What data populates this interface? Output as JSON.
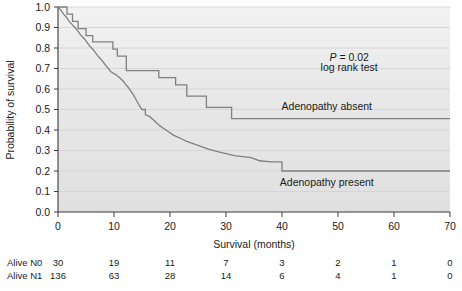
{
  "chart_data": {
    "type": "line",
    "title": "",
    "xlabel": "Survival (months)",
    "ylabel": "Probability of survival",
    "xlim": [
      0,
      70
    ],
    "ylim": [
      0,
      1.0
    ],
    "xticks": [
      0,
      10,
      20,
      30,
      40,
      50,
      60,
      70
    ],
    "yticks": [
      "0.0",
      "0.1",
      "0.2",
      "0.3",
      "0.4",
      "0.5",
      "0.6",
      "0.7",
      "0.8",
      "0.9",
      "1.0"
    ],
    "grid": true,
    "legend": "inline-labels",
    "annotations": [
      {
        "name": "p-value",
        "text": "P = 0.02",
        "x": 52,
        "y": 0.755
      },
      {
        "name": "test-name",
        "text": "log rank test",
        "x": 52,
        "y": 0.705
      },
      {
        "name": "series-label-absent",
        "text": "Adenopathy absent",
        "x": 48,
        "y": 0.515
      },
      {
        "name": "series-label-present",
        "text": "Adenopathy present",
        "x": 48,
        "y": 0.145
      }
    ],
    "series": [
      {
        "name": "Adenopathy absent",
        "group": "N0",
        "color": "#808080",
        "points": [
          [
            0,
            1.0
          ],
          [
            1.6,
            1.0
          ],
          [
            1.6,
            0.965
          ],
          [
            2.6,
            0.965
          ],
          [
            2.6,
            0.93
          ],
          [
            3.6,
            0.93
          ],
          [
            3.6,
            0.895
          ],
          [
            5.0,
            0.895
          ],
          [
            5.0,
            0.86
          ],
          [
            6.2,
            0.86
          ],
          [
            6.2,
            0.83
          ],
          [
            9.8,
            0.83
          ],
          [
            9.8,
            0.795
          ],
          [
            10.6,
            0.795
          ],
          [
            10.6,
            0.76
          ],
          [
            12.2,
            0.76
          ],
          [
            12.2,
            0.69
          ],
          [
            18.0,
            0.69
          ],
          [
            18.0,
            0.655
          ],
          [
            21.0,
            0.655
          ],
          [
            21.0,
            0.62
          ],
          [
            23.0,
            0.62
          ],
          [
            23.0,
            0.565
          ],
          [
            26.5,
            0.565
          ],
          [
            26.5,
            0.51
          ],
          [
            31.0,
            0.51
          ],
          [
            31.0,
            0.455
          ],
          [
            70,
            0.455
          ]
        ]
      },
      {
        "name": "Adenopathy present",
        "group": "N1",
        "color": "#808080",
        "points": [
          [
            0,
            1.0
          ],
          [
            0.5,
            0.985
          ],
          [
            1.0,
            0.965
          ],
          [
            1.5,
            0.95
          ],
          [
            2.0,
            0.93
          ],
          [
            2.5,
            0.915
          ],
          [
            3.0,
            0.9
          ],
          [
            3.5,
            0.885
          ],
          [
            4.0,
            0.865
          ],
          [
            4.5,
            0.85
          ],
          [
            5.0,
            0.835
          ],
          [
            5.5,
            0.815
          ],
          [
            6.0,
            0.8
          ],
          [
            6.5,
            0.785
          ],
          [
            7.0,
            0.765
          ],
          [
            7.5,
            0.75
          ],
          [
            8.0,
            0.735
          ],
          [
            8.5,
            0.715
          ],
          [
            9.0,
            0.7
          ],
          [
            9.4,
            0.685
          ],
          [
            10.0,
            0.675
          ],
          [
            10.6,
            0.665
          ],
          [
            11.0,
            0.655
          ],
          [
            11.6,
            0.64
          ],
          [
            12.0,
            0.625
          ],
          [
            12.5,
            0.61
          ],
          [
            13.0,
            0.59
          ],
          [
            13.5,
            0.57
          ],
          [
            14.0,
            0.545
          ],
          [
            14.5,
            0.52
          ],
          [
            15.0,
            0.5
          ],
          [
            15.6,
            0.5
          ],
          [
            15.6,
            0.475
          ],
          [
            16.4,
            0.465
          ],
          [
            17.0,
            0.45
          ],
          [
            17.6,
            0.435
          ],
          [
            18.2,
            0.42
          ],
          [
            19.0,
            0.405
          ],
          [
            19.8,
            0.39
          ],
          [
            20.6,
            0.375
          ],
          [
            21.4,
            0.365
          ],
          [
            22.2,
            0.355
          ],
          [
            23.0,
            0.345
          ],
          [
            24.0,
            0.335
          ],
          [
            25.0,
            0.325
          ],
          [
            26.0,
            0.315
          ],
          [
            27.0,
            0.305
          ],
          [
            28.5,
            0.295
          ],
          [
            30.0,
            0.285
          ],
          [
            31.5,
            0.275
          ],
          [
            33.0,
            0.27
          ],
          [
            34.5,
            0.265
          ],
          [
            36.0,
            0.25
          ],
          [
            38.0,
            0.245
          ],
          [
            40.0,
            0.245
          ],
          [
            40.0,
            0.2
          ],
          [
            70,
            0.2
          ]
        ]
      }
    ],
    "risk_table": {
      "x_positions": [
        0,
        10,
        20,
        30,
        40,
        50,
        60,
        70
      ],
      "rows": [
        {
          "label": "Alive N0",
          "values": [
            "30",
            "19",
            "11",
            "7",
            "3",
            "2",
            "1",
            "0"
          ]
        },
        {
          "label": "Alive N1",
          "values": [
            "136",
            "63",
            "28",
            "14",
            "6",
            "4",
            "1",
            "0"
          ]
        }
      ]
    },
    "style": {
      "plot_background": "#e6e6e6",
      "grid_color": "#d0d0d0",
      "axis_color": "#3a3a3a",
      "curve_color": "#7a7a7a"
    }
  }
}
